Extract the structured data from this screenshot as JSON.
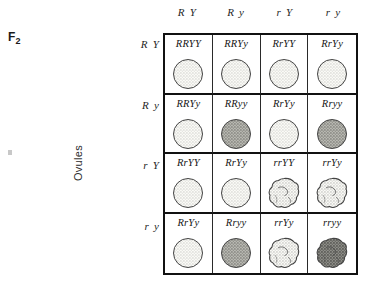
{
  "generation_label": "F",
  "generation_subscript": "2",
  "axis": {
    "ovules_label": "Ovules"
  },
  "columns": [
    {
      "label": "R Y",
      "allele_pair": "RY"
    },
    {
      "label": "R y",
      "allele_pair": "Ry"
    },
    {
      "label": "r Y",
      "allele_pair": "rY"
    },
    {
      "label": "r y",
      "allele_pair": "ry"
    }
  ],
  "rows": [
    {
      "label": "R Y",
      "allele_pair": "RY"
    },
    {
      "label": "R y",
      "allele_pair": "Ry"
    },
    {
      "label": "r Y",
      "allele_pair": "rY"
    },
    {
      "label": "r y",
      "allele_pair": "ry"
    }
  ],
  "colors": {
    "ink": "#111111",
    "grid_line": "#2a2a2a",
    "seed_outline": "#444444",
    "seed_yellow_fill": "#fbfbf7",
    "seed_green_fill": "#b9b9b3",
    "seed_green_wrinkled_fill": "#8f8f89",
    "page_background": "#ffffff"
  },
  "cells": [
    {
      "genotype": "RRYY",
      "shape": "round",
      "color": "yellow",
      "row": 0,
      "col": 0
    },
    {
      "genotype": "RRYy",
      "shape": "round",
      "color": "yellow",
      "row": 0,
      "col": 1
    },
    {
      "genotype": "RrYY",
      "shape": "round",
      "color": "yellow",
      "row": 0,
      "col": 2
    },
    {
      "genotype": "RrYy",
      "shape": "round",
      "color": "yellow",
      "row": 0,
      "col": 3
    },
    {
      "genotype": "RRYy",
      "shape": "round",
      "color": "yellow",
      "row": 1,
      "col": 0
    },
    {
      "genotype": "RRyy",
      "shape": "round",
      "color": "green",
      "row": 1,
      "col": 1
    },
    {
      "genotype": "RrYy",
      "shape": "round",
      "color": "yellow",
      "row": 1,
      "col": 2
    },
    {
      "genotype": "Rryy",
      "shape": "round",
      "color": "green",
      "row": 1,
      "col": 3
    },
    {
      "genotype": "RrYY",
      "shape": "round",
      "color": "yellow",
      "row": 2,
      "col": 0
    },
    {
      "genotype": "RrYy",
      "shape": "round",
      "color": "yellow",
      "row": 2,
      "col": 1
    },
    {
      "genotype": "rrYY",
      "shape": "wrinkled",
      "color": "yellow",
      "row": 2,
      "col": 2
    },
    {
      "genotype": "rrYy",
      "shape": "wrinkled",
      "color": "yellow",
      "row": 2,
      "col": 3
    },
    {
      "genotype": "RrYy",
      "shape": "round",
      "color": "yellow",
      "row": 3,
      "col": 0
    },
    {
      "genotype": "Rryy",
      "shape": "round",
      "color": "green",
      "row": 3,
      "col": 1
    },
    {
      "genotype": "rrYy",
      "shape": "wrinkled",
      "color": "yellow",
      "row": 3,
      "col": 2
    },
    {
      "genotype": "rryy",
      "shape": "wrinkled",
      "color": "green",
      "row": 3,
      "col": 3
    }
  ]
}
